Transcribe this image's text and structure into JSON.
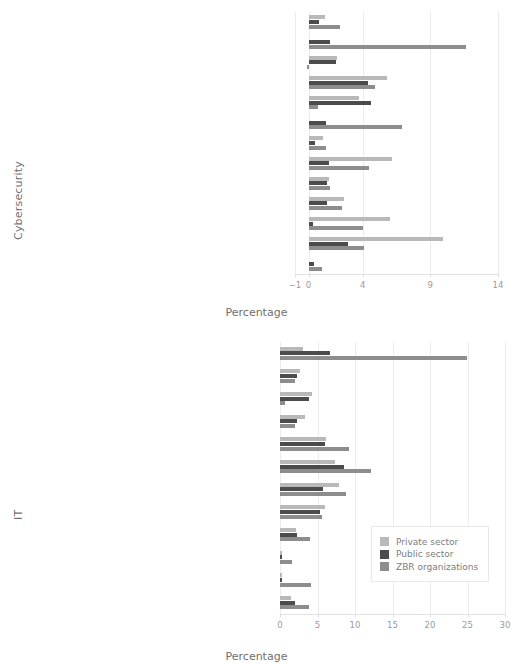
{
  "figure": {
    "legend": {
      "entries": [
        {
          "label": "Private sector",
          "color": "#b9b9b9",
          "key": "private"
        },
        {
          "label": "Public sector",
          "color": "#4c4c4c",
          "key": "public"
        },
        {
          "label": "ZBR organizations",
          "color": "#8d8d8d",
          "key": "zbr"
        }
      ]
    }
  },
  "chart_data": [
    {
      "type": "bar",
      "orientation": "horizontal",
      "title": "",
      "xlabel": "Percentage",
      "ylabel": "Cybersecurity",
      "xlim": [
        -1,
        14
      ],
      "xticks": [
        -1,
        0,
        4,
        9,
        14
      ],
      "xticklabels": [
        "−1",
        "0",
        "4",
        "9",
        "14"
      ],
      "grid": true,
      "legend_position": "none",
      "categories": [
        "Cyber Defense Forensics Analyst (212)",
        "Systems Security Analyst (461)",
        "Cyber Defense Analyst (511)",
        "Cyber Defense Infrastructure Support Specialist (521)",
        "Cyber Defense Incident Responder (531)",
        "Vulnerability Assessment Analyst (541)",
        "Authorizing Official/Designating Representative (611)",
        "Security Control Assessor (612)",
        "Secure Software Assessor (622)",
        "Information Systems Security Developer (631)",
        "Security Architect (652)",
        "Information Systems Security Manager (722)",
        "COMSEC Manager (723)"
      ],
      "series": [
        {
          "name": "Private sector",
          "values": [
            1.2,
            0.0,
            2.1,
            5.8,
            3.7,
            0.0,
            1.1,
            6.2,
            1.5,
            2.6,
            6.0,
            9.9,
            0.0
          ]
        },
        {
          "name": "Public sector",
          "values": [
            0.8,
            1.6,
            2.0,
            4.4,
            4.6,
            1.3,
            0.5,
            1.5,
            1.4,
            1.4,
            0.3,
            2.9,
            0.4
          ]
        },
        {
          "name": "ZBR organizations",
          "values": [
            2.3,
            11.6,
            -0.1,
            4.9,
            0.7,
            6.9,
            1.3,
            4.5,
            1.6,
            2.5,
            4.0,
            4.1,
            1.0
          ]
        }
      ]
    },
    {
      "type": "bar",
      "orientation": "horizontal",
      "title": "",
      "xlabel": "Percentage",
      "ylabel": "IT",
      "xlim": [
        0,
        30
      ],
      "xticks": [
        0,
        5,
        10,
        15,
        20,
        25,
        30
      ],
      "xticklabels": [
        "0",
        "5",
        "10",
        "15",
        "20",
        "25",
        "30"
      ],
      "grid": true,
      "legend_position": "center-right",
      "categories": [
        "Technical Support Specialist (411)",
        "Database Administrator (421)",
        "Data Analyst (422)",
        "Knowledge Manager (431)",
        "Network Operations Specialist (441)",
        "Systems Administrator (451)",
        "Software Developer (621)",
        "Systems Developer (632)",
        "Systems Requirements Planner (641)",
        "Enterprise Architect (651)",
        "Research and Development Specialist (661)",
        "System Testing and Evaluation Specialist (671)"
      ],
      "series": [
        {
          "name": "Private sector",
          "values": [
            3.1,
            2.6,
            4.2,
            3.3,
            6.1,
            7.3,
            7.9,
            6.0,
            2.1,
            0.2,
            0.2,
            1.4
          ]
        },
        {
          "name": "Public sector",
          "values": [
            6.7,
            2.3,
            3.8,
            2.2,
            6.0,
            8.5,
            5.7,
            5.3,
            2.2,
            0.2,
            0.3,
            2.0
          ]
        },
        {
          "name": "ZBR organizations",
          "values": [
            24.9,
            2.0,
            0.6,
            2.0,
            9.2,
            12.1,
            8.8,
            5.6,
            4.0,
            1.6,
            4.1,
            3.9
          ]
        }
      ]
    }
  ]
}
